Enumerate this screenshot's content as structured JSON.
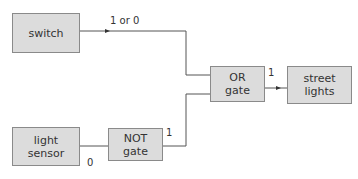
{
  "diagram": {
    "nodes": {
      "switch": {
        "label": "switch"
      },
      "light_sensor": {
        "label_line1": "light",
        "label_line2": "sensor"
      },
      "not_gate": {
        "label_line1": "NOT",
        "label_line2": "gate"
      },
      "or_gate": {
        "label_line1": "OR",
        "label_line2": "gate"
      },
      "street_lights": {
        "label_line1": "street",
        "label_line2": "lights"
      }
    },
    "edge_labels": {
      "switch_output": "1 or 0",
      "sensor_output": "0",
      "not_output": "1",
      "or_output": "1"
    },
    "colors": {
      "box_fill": "#dcdcdc",
      "box_border": "#8a8a8a",
      "wire": "#555555"
    }
  }
}
